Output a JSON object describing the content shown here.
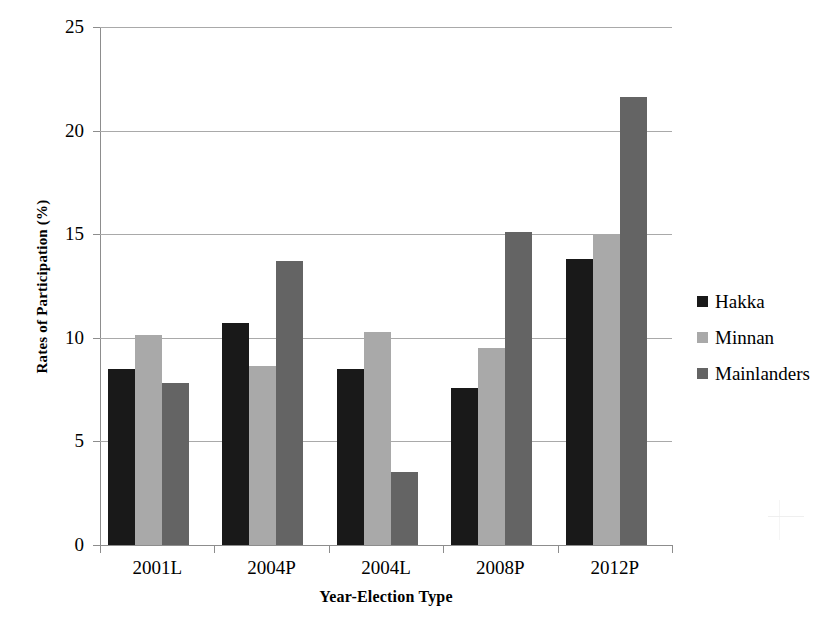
{
  "chart_data": {
    "type": "bar",
    "title": "",
    "xlabel": "Year-Election Type",
    "ylabel": "Rates of Participation (%)",
    "categories": [
      "2001L",
      "2004P",
      "2004L",
      "2008P",
      "2012P"
    ],
    "series": [
      {
        "name": "Hakka",
        "color": "#191919",
        "values": [
          8.5,
          10.7,
          8.5,
          7.6,
          13.8
        ]
      },
      {
        "name": "Minnan",
        "color": "#a9a9a9",
        "values": [
          10.15,
          8.65,
          10.3,
          9.5,
          15.0
        ]
      },
      {
        "name": "Mainlanders",
        "color": "#646464",
        "values": [
          7.8,
          13.7,
          3.5,
          15.1,
          21.6
        ]
      }
    ],
    "ylim": [
      0,
      25
    ],
    "yticks": [
      0,
      5,
      10,
      15,
      20,
      25
    ],
    "ytick_labels": [
      "0",
      "5",
      "10",
      "15",
      "20",
      "25"
    ],
    "grid": true,
    "legend_position": "right"
  }
}
